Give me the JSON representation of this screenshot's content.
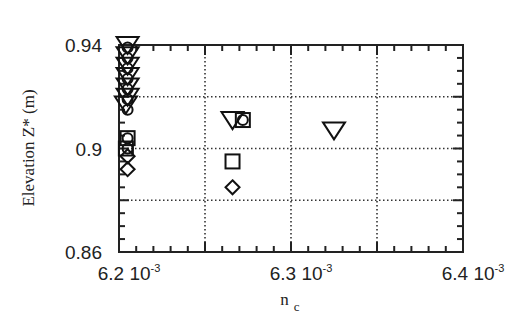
{
  "chart_data": {
    "type": "scatter",
    "title": "",
    "xlabel": "n_c",
    "ylabel": "Elevation Z* (m)",
    "xlim": [
      0.0062,
      0.0064
    ],
    "ylim": [
      0.86,
      0.94
    ],
    "x_ticks": [
      {
        "value": 0.0062,
        "mantissa": "6.2",
        "base": "10",
        "exp": "-3"
      },
      {
        "value": 0.0063,
        "mantissa": "6.3",
        "base": "10",
        "exp": "-3"
      },
      {
        "value": 0.0064,
        "mantissa": "6.4",
        "base": "10",
        "exp": "-3"
      }
    ],
    "y_ticks": [
      {
        "value": 0.94,
        "label": "0.94"
      },
      {
        "value": 0.9,
        "label": "0.9"
      },
      {
        "value": 0.86,
        "label": "0.86"
      }
    ],
    "grid": {
      "on": true,
      "style": "dotted",
      "x": [
        0.00625,
        0.0063,
        0.00635
      ],
      "y": [
        0.88,
        0.9,
        0.92
      ]
    },
    "legend": null,
    "series": [
      {
        "name": "triangle",
        "marker": "triangle-down",
        "points": [
          {
            "x": 0.006205,
            "y": 0.94
          },
          {
            "x": 0.006205,
            "y": 0.936
          },
          {
            "x": 0.006205,
            "y": 0.932
          },
          {
            "x": 0.006205,
            "y": 0.928
          },
          {
            "x": 0.006205,
            "y": 0.924
          },
          {
            "x": 0.006205,
            "y": 0.92
          },
          {
            "x": 0.006204,
            "y": 0.917
          },
          {
            "x": 0.006266,
            "y": 0.911
          },
          {
            "x": 0.006325,
            "y": 0.907
          }
        ]
      },
      {
        "name": "circle",
        "marker": "circle",
        "points": [
          {
            "x": 0.006205,
            "y": 0.939
          },
          {
            "x": 0.006205,
            "y": 0.935
          },
          {
            "x": 0.006205,
            "y": 0.931
          },
          {
            "x": 0.006205,
            "y": 0.927
          },
          {
            "x": 0.006205,
            "y": 0.923
          },
          {
            "x": 0.006205,
            "y": 0.919
          },
          {
            "x": 0.006205,
            "y": 0.915
          },
          {
            "x": 0.006205,
            "y": 0.904
          },
          {
            "x": 0.006205,
            "y": 0.9
          },
          {
            "x": 0.006272,
            "y": 0.911
          }
        ]
      },
      {
        "name": "square",
        "marker": "square",
        "points": [
          {
            "x": 0.006205,
            "y": 0.904
          },
          {
            "x": 0.006204,
            "y": 0.9
          },
          {
            "x": 0.006272,
            "y": 0.911
          },
          {
            "x": 0.006266,
            "y": 0.895
          }
        ]
      },
      {
        "name": "diamond",
        "marker": "diamond",
        "points": [
          {
            "x": 0.006205,
            "y": 0.897
          },
          {
            "x": 0.006205,
            "y": 0.892
          },
          {
            "x": 0.006266,
            "y": 0.885
          }
        ]
      }
    ]
  }
}
